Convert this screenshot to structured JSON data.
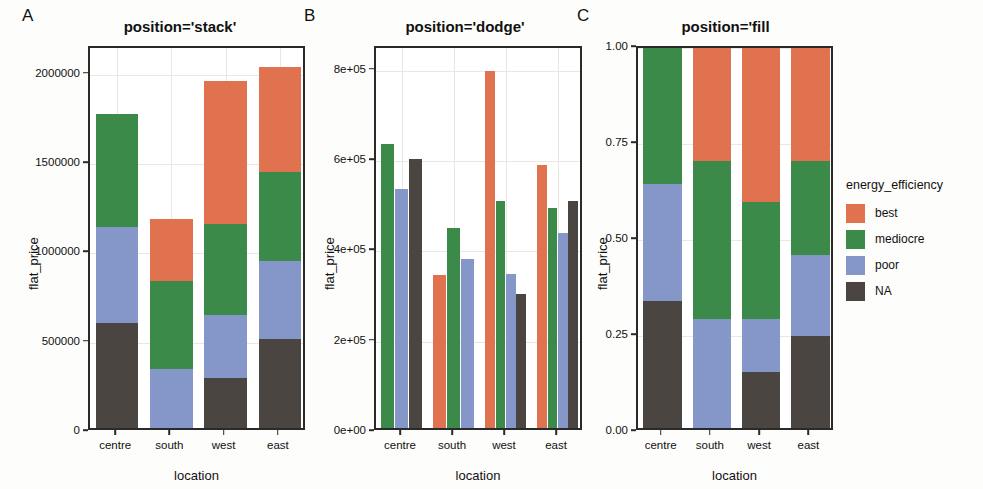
{
  "legend": {
    "title": "energy_efficiency",
    "entries": [
      {
        "label": "best",
        "color": "#E1724F"
      },
      {
        "label": "mediocre",
        "color": "#3C8A4A"
      },
      {
        "label": "poor",
        "color": "#8596C8"
      },
      {
        "label": "NA",
        "color": "#4A4540"
      }
    ]
  },
  "panels": [
    {
      "letter": "A",
      "title": "position='stack'",
      "xlabel": "location",
      "ylabel": "flat_price",
      "yticks": [
        "0",
        "500000",
        "1000000",
        "1500000",
        "2000000"
      ],
      "xticks": [
        "centre",
        "south",
        "west",
        "east"
      ]
    },
    {
      "letter": "B",
      "title": "position='dodge'",
      "xlabel": "location",
      "ylabel": "flat_price",
      "yticks": [
        "0e+00",
        "2e+05",
        "4e+05",
        "6e+05",
        "8e+05"
      ],
      "xticks": [
        "centre",
        "south",
        "west",
        "east"
      ]
    },
    {
      "letter": "C",
      "title": "position='fill",
      "xlabel": "location",
      "ylabel": "flat_price",
      "yticks": [
        "0.00",
        "0.25",
        "0.50",
        "0.75",
        "1.00"
      ],
      "xticks": [
        "centre",
        "south",
        "west",
        "east"
      ]
    }
  ],
  "chart_data": [
    {
      "type": "bar",
      "id": "panel-a-stack",
      "title": "position='stack'",
      "subtitle": "A",
      "xlabel": "location",
      "ylabel": "flat_price",
      "categories": [
        "centre",
        "south",
        "west",
        "east"
      ],
      "stacked": true,
      "stack_order_bottom_to_top": [
        "NA",
        "poor",
        "mediocre",
        "best"
      ],
      "ylim": [
        0,
        2150000
      ],
      "ytick_values": [
        0,
        500000,
        1000000,
        1500000,
        2000000
      ],
      "grid": true,
      "legend_position": "right",
      "series": [
        {
          "name": "NA",
          "color": "#4A4540",
          "values": [
            608000,
            0,
            305000,
            518000
          ]
        },
        {
          "name": "poor",
          "color": "#8596C8",
          "values": [
            537000,
            351000,
            350000,
            440000
          ]
        },
        {
          "name": "mediocre",
          "color": "#3C8A4A",
          "values": [
            637000,
            492000,
            512000,
            495000
          ]
        },
        {
          "name": "best",
          "color": "#E1724F",
          "values": [
            0,
            348000,
            798000,
            592000
          ]
        }
      ],
      "totals": [
        1782000,
        1191000,
        1965000,
        2045000
      ]
    },
    {
      "type": "bar",
      "id": "panel-b-dodge",
      "title": "position='dodge'",
      "subtitle": "B",
      "xlabel": "location",
      "ylabel": "flat_price",
      "categories": [
        "centre",
        "south",
        "west",
        "east"
      ],
      "stacked": false,
      "grouped": true,
      "group_order": [
        "best",
        "mediocre",
        "poor",
        "NA"
      ],
      "ylim": [
        0,
        850000
      ],
      "ytick_values": [
        0,
        200000,
        400000,
        600000,
        800000
      ],
      "grid": true,
      "legend_position": "right",
      "note": "centre group has no 'best' bar",
      "series": [
        {
          "name": "best",
          "color": "#E1724F",
          "values": [
            null,
            348000,
            798000,
            592000
          ]
        },
        {
          "name": "mediocre",
          "color": "#3C8A4A",
          "values": [
            637000,
            452000,
            512000,
            495000
          ]
        },
        {
          "name": "poor",
          "color": "#8596C8",
          "values": [
            537000,
            384000,
            350000,
            440000
          ]
        },
        {
          "name": "NA",
          "color": "#4A4540",
          "values": [
            605000,
            0,
            305000,
            512000
          ]
        }
      ]
    },
    {
      "type": "bar",
      "id": "panel-c-fill",
      "title": "position='fill",
      "subtitle": "C",
      "xlabel": "location",
      "ylabel": "flat_price",
      "categories": [
        "centre",
        "south",
        "west",
        "east"
      ],
      "stacked": true,
      "normalized": true,
      "stack_order_bottom_to_top": [
        "NA",
        "poor",
        "mediocre",
        "best"
      ],
      "ylim": [
        0,
        1
      ],
      "ytick_values": [
        0.0,
        0.25,
        0.5,
        0.75,
        1.0
      ],
      "grid": true,
      "legend_position": "right",
      "note": "south bar has no 'NA' segment",
      "series": [
        {
          "name": "NA",
          "color": "#4A4540",
          "values": [
            0.34,
            0.0,
            0.155,
            0.25
          ]
        },
        {
          "name": "poor",
          "color": "#8596C8",
          "values": [
            0.305,
            0.295,
            0.14,
            0.21
          ]
        },
        {
          "name": "mediocre",
          "color": "#3C8A4A",
          "values": [
            0.355,
            0.41,
            0.305,
            0.245
          ]
        },
        {
          "name": "best",
          "color": "#E1724F",
          "values": [
            0.0,
            0.295,
            0.4,
            0.295
          ]
        }
      ]
    }
  ]
}
